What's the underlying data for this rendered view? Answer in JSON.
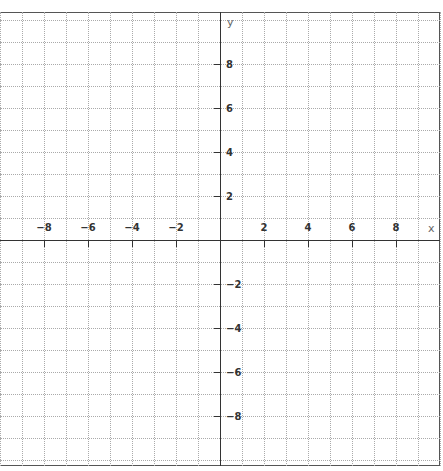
{
  "chart_data": {
    "type": "scatter",
    "title": "",
    "xlabel": "x",
    "ylabel": "y",
    "xlim": [
      -10,
      10
    ],
    "ylim": [
      -10,
      10
    ],
    "x_ticks": [
      "-8",
      "-6",
      "-4",
      "-2",
      "2",
      "4",
      "6",
      "8"
    ],
    "y_ticks": [
      "8",
      "6",
      "4",
      "2",
      "-2",
      "-4",
      "-6",
      "-8"
    ],
    "grid": true,
    "series": []
  }
}
